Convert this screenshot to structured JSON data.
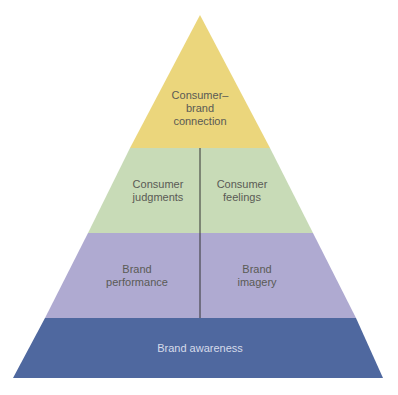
{
  "diagram": {
    "type": "pyramid",
    "title": "",
    "levels": [
      {
        "name": "top",
        "lines": [
          "Consumer–",
          "brand",
          "connection"
        ],
        "color": "#ebd67c"
      },
      {
        "name": "judgments-feelings",
        "left": {
          "lines": [
            "Consumer",
            "judgments"
          ]
        },
        "right": {
          "lines": [
            "Consumer",
            "feelings"
          ]
        },
        "color": "#c8dbb7"
      },
      {
        "name": "performance-imagery",
        "left": {
          "lines": [
            "Brand",
            "performance"
          ]
        },
        "right": {
          "lines": [
            "Brand",
            "imagery"
          ]
        },
        "color": "#afaad1"
      },
      {
        "name": "base",
        "lines": [
          "Brand awareness"
        ],
        "color": "#4f689f"
      }
    ],
    "divider_color": "#333333"
  }
}
